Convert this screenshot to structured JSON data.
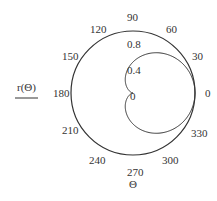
{
  "chart_data": {
    "type": "polar",
    "title": "",
    "xlabel": "Θ",
    "ylabel": "r(Θ)",
    "angular_ticks": [
      0,
      30,
      60,
      90,
      120,
      150,
      180,
      210,
      240,
      270,
      300,
      330
    ],
    "radial_ticks": [
      0,
      0.4,
      0.8
    ],
    "rlim": [
      0,
      1
    ],
    "series": [
      {
        "name": "r(Θ)",
        "formula": "r = (1 + cos Θ) / 2",
        "theta_deg": [
          0,
          30,
          60,
          90,
          120,
          150,
          180,
          210,
          240,
          270,
          300,
          330,
          360
        ],
        "r": [
          1.0,
          0.933,
          0.75,
          0.5,
          0.25,
          0.067,
          0.0,
          0.067,
          0.25,
          0.5,
          0.75,
          0.933,
          1.0
        ],
        "color": "#333333"
      }
    ],
    "grid": false,
    "legend": {
      "entries": [
        "r(Θ)"
      ],
      "position": "left"
    }
  },
  "labels": {
    "angular": [
      "0",
      "30",
      "60",
      "90",
      "120",
      "150",
      "180",
      "210",
      "240",
      "270",
      "300",
      "330"
    ],
    "radial": [
      "0",
      "0.4",
      "0.8"
    ],
    "xlabel": "Θ",
    "legend": "r(Θ)"
  },
  "colors": {
    "line": "#333333",
    "text": "#333333",
    "background": "#ffffff"
  }
}
